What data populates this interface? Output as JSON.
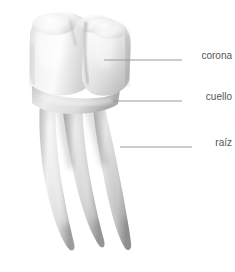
{
  "figure": {
    "title": "",
    "title_clipped": true,
    "background_color": "#ffffff",
    "width": 235,
    "height": 272
  },
  "style": {
    "label_color": "#555555",
    "leader_line_color": "#9a9a9a",
    "tooth_light": "#fdfdfd",
    "tooth_mid": "#dcdcdc",
    "tooth_shadow": "#a8a8a8",
    "tooth_deep_shadow": "#8d8d8d"
  },
  "callouts": [
    {
      "id": "corona",
      "label": "corona",
      "line_y": 60,
      "line_x_start": 104,
      "line_x_end": 182,
      "label_right": 232,
      "label_top": 50
    },
    {
      "id": "cuello",
      "label": "cuello",
      "line_y": 101,
      "line_x_start": 113,
      "line_x_end": 182,
      "label_right": 232,
      "label_top": 91
    },
    {
      "id": "raiz",
      "label": "raíz",
      "line_y": 147,
      "line_x_start": 120,
      "line_x_end": 192,
      "label_right": 232,
      "label_top": 137
    }
  ]
}
